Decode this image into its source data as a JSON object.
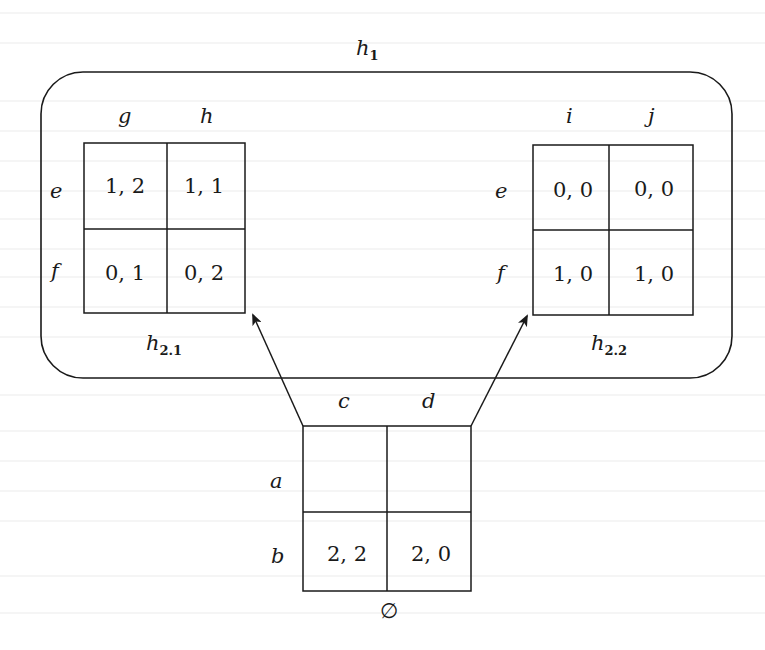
{
  "diagram": {
    "type": "extensive-form game tree with normal-form stage games",
    "colors": {
      "stroke": "#1a1a1a",
      "background": "#ffffff",
      "bleed_through": "#ececec"
    },
    "root_node": {
      "label": "∅",
      "row_labels": [
        "a",
        "b"
      ],
      "col_labels": [
        "c",
        "d"
      ],
      "cells": [
        [
          "",
          ""
        ],
        [
          "2, 2",
          "2, 0"
        ]
      ]
    },
    "history_set": {
      "label": "h",
      "label_sub": "1",
      "subgames": [
        {
          "label": "h",
          "label_sub": "2.1",
          "row_labels": [
            "e",
            "f"
          ],
          "col_labels": [
            "g",
            "h"
          ],
          "cells": [
            [
              "1, 2",
              "1, 1"
            ],
            [
              "0, 1",
              "0, 2"
            ]
          ]
        },
        {
          "label": "h",
          "label_sub": "2.2",
          "row_labels": [
            "e",
            "f"
          ],
          "col_labels": [
            "i",
            "j"
          ],
          "cells": [
            [
              "0, 0",
              "0, 0"
            ],
            [
              "1, 0",
              "1, 0"
            ]
          ]
        }
      ]
    },
    "edges": [
      {
        "from": "root-cell-a-c",
        "to": "subgame-h2.1"
      },
      {
        "from": "root-cell-a-d",
        "to": "subgame-h2.2"
      }
    ]
  }
}
